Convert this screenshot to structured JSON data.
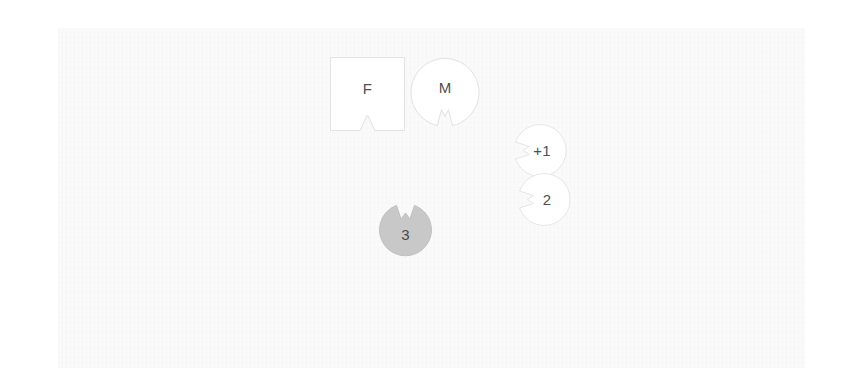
{
  "diagram": {
    "background_color": "#ffffff",
    "page_color": "#fafafa",
    "shapes": [
      {
        "id": "f-square",
        "label": "F",
        "form": "square",
        "notch": "bottom-center-v",
        "fill": "#ffffff",
        "stroke": "#e2e2e2",
        "text_color": "#4f4f4f"
      },
      {
        "id": "m-circle",
        "label": "M",
        "form": "circle",
        "notch": "bottom-center-v",
        "fill": "#ffffff",
        "stroke": "#e2e2e2",
        "text_color": "#4f4f4f"
      },
      {
        "id": "plus1-circle",
        "label": "+1",
        "form": "circle",
        "notch": "left-center-v",
        "fill": "#ffffff",
        "stroke": "#e6e6e6",
        "text_color": "#4f4f4f"
      },
      {
        "id": "two-circle",
        "label": "2",
        "form": "circle",
        "notch": "left-center-v",
        "fill": "#ffffff",
        "stroke": "#e6e6e6",
        "text_color": "#4f4f4f"
      },
      {
        "id": "three-circle",
        "label": "3",
        "form": "circle",
        "notch": "top-center-v",
        "fill": "#c8c8c8",
        "stroke": "#c0c0c0",
        "text_color": "#4a4a4a"
      }
    ]
  }
}
